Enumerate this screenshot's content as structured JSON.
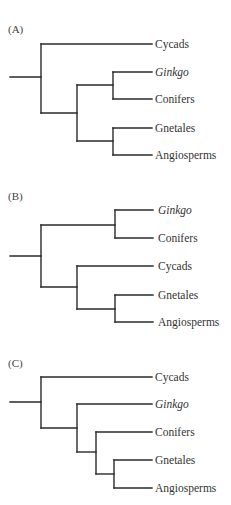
{
  "figure": {
    "panels": [
      {
        "label": "(A)",
        "leaves": [
          {
            "name": "Cycads",
            "italic": false
          },
          {
            "name": "Ginkgo",
            "italic": true
          },
          {
            "name": "Conifers",
            "italic": false
          },
          {
            "name": "Gnetales",
            "italic": false
          },
          {
            "name": "Angiosperms",
            "italic": false
          }
        ],
        "newick": "(Cycads,((Ginkgo,Conifers),(Gnetales,Angiosperms)));"
      },
      {
        "label": "(B)",
        "leaves": [
          {
            "name": "Ginkgo",
            "italic": true
          },
          {
            "name": "Conifers",
            "italic": false
          },
          {
            "name": "Cycads",
            "italic": false
          },
          {
            "name": "Gnetales",
            "italic": false
          },
          {
            "name": "Angiosperms",
            "italic": false
          }
        ],
        "newick": "((Ginkgo,Conifers),(Cycads,(Gnetales,Angiosperms)));"
      },
      {
        "label": "(C)",
        "leaves": [
          {
            "name": "Cycads",
            "italic": false
          },
          {
            "name": "Ginkgo",
            "italic": true
          },
          {
            "name": "Conifers",
            "italic": false
          },
          {
            "name": "Gnetales",
            "italic": false
          },
          {
            "name": "Angiosperms",
            "italic": false
          }
        ],
        "newick": "(Cycads,(Ginkgo,(Conifers,(Gnetales,Angiosperms))));"
      }
    ]
  }
}
